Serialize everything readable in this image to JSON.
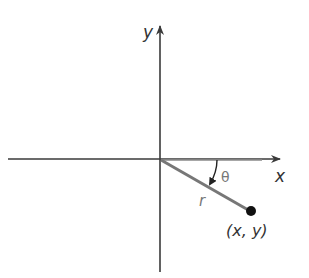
{
  "diagram": {
    "type": "polar-coordinates",
    "axis_x_label": "x",
    "axis_y_label": "y",
    "radius_label": "r",
    "angle_label": "θ",
    "point_label": "(x, y)",
    "colors": {
      "axis": "#3a3a3a",
      "radius": "#777777",
      "point": "#111111",
      "text": "#333333"
    }
  }
}
